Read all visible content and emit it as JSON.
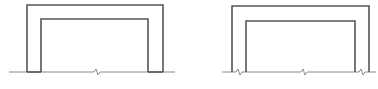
{
  "diagram": {
    "type": "structural-frame-sketch",
    "stroke_color": "#555555",
    "ground_color": "#8a8a8a",
    "figures": [
      {
        "name": "frame-left",
        "description": "U-shaped portal frame (inverted) resting on ground line; legs stand on ground, single break symbol at center of ground line",
        "outer": {
          "x1": 27,
          "y_top": 5,
          "x2": 163,
          "y_base": 72
        },
        "inner": {
          "x1": 41,
          "y_top": 19,
          "x2": 148,
          "y_base": 72
        },
        "ground": {
          "x1": 9,
          "x2": 175,
          "y": 72
        },
        "break_symbols_x": [
          97
        ]
      },
      {
        "name": "frame-right",
        "description": "Inverted U-shaped portal frame; legs embedded with break symbols between each leg pair and at center of ground line",
        "outer": {
          "x1": 232,
          "y_top": 6,
          "x2": 369,
          "y_base": 72
        },
        "inner": {
          "x1": 246,
          "y_top": 21,
          "x2": 355,
          "y_base": 72
        },
        "ground": {
          "x1": 222,
          "x2": 376,
          "y": 72
        },
        "break_symbols_x": [
          239,
          304,
          362
        ]
      }
    ]
  }
}
